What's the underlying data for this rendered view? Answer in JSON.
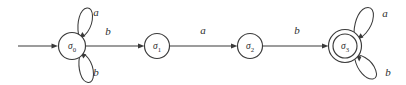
{
  "figure": {
    "kind": "finite-state-automaton-diagram",
    "colors": {
      "stroke": "#3a3a3a",
      "text": "#2e2e2e",
      "background": "#ffffff"
    },
    "start_marker": {
      "name": "start-arrow",
      "from_x": 18,
      "to_x": 58,
      "y": 46
    },
    "states": [
      {
        "id": "q0",
        "label_base": "σ",
        "label_sub": "0",
        "cx": 72,
        "cy": 46,
        "r": 13.5,
        "accepting": false,
        "initial": true
      },
      {
        "id": "q1",
        "label_base": "σ",
        "label_sub": "1",
        "cx": 157,
        "cy": 46,
        "r": 12.5,
        "accepting": false,
        "initial": false
      },
      {
        "id": "q2",
        "label_base": "σ",
        "label_sub": "2",
        "cx": 250,
        "cy": 46,
        "r": 12.5,
        "accepting": false,
        "initial": false
      },
      {
        "id": "q3",
        "label_base": "σ",
        "label_sub": "3",
        "cx": 345,
        "cy": 46,
        "r": 16.5,
        "r_inner": 12,
        "accepting": true,
        "initial": false
      }
    ],
    "transitions": [
      {
        "from": "q0",
        "to": "q1",
        "symbol": "b",
        "label_x": 108,
        "label_y": 32,
        "kind": "straight"
      },
      {
        "from": "q1",
        "to": "q2",
        "symbol": "a",
        "label_x": 203,
        "label_y": 31,
        "kind": "straight"
      },
      {
        "from": "q2",
        "to": "q3",
        "symbol": "b",
        "label_x": 297,
        "label_y": 31,
        "kind": "straight"
      },
      {
        "from": "q0",
        "to": "q0",
        "symbol": "a",
        "label_x": 96,
        "label_y": 13,
        "kind": "self-loop-up"
      },
      {
        "from": "q0",
        "to": "q0",
        "symbol": "b",
        "label_x": 96,
        "label_y": 73,
        "kind": "self-loop-down"
      },
      {
        "from": "q3",
        "to": "q3",
        "symbol": "a",
        "label_x": 385,
        "label_y": 14,
        "kind": "self-loop-up"
      },
      {
        "from": "q3",
        "to": "q3",
        "symbol": "b",
        "label_x": 388,
        "label_y": 73,
        "kind": "self-loop-down"
      }
    ]
  }
}
